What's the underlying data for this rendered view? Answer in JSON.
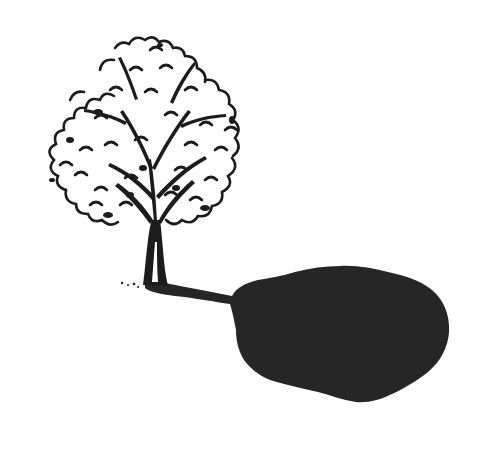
{
  "image": {
    "title": "Tree with shadow illustration",
    "description": "Black ink line drawing of a deciduous tree with a large, dark, blob-shaped shadow extending to the lower right",
    "colors": {
      "background": "#ffffff",
      "ink": "#1c1c1c",
      "shadow": "#262626"
    },
    "elements": [
      "tree-canopy",
      "tree-trunk",
      "ground-tufts",
      "tree-shadow"
    ]
  }
}
